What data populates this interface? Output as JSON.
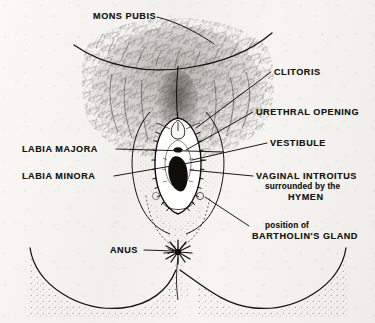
{
  "figure": {
    "media": "pen-and-ink stipple drawing on paper",
    "ink_color": "#16150f",
    "paper_color": "#f4f3f0"
  },
  "labels": {
    "mons_pubis": "MONS PUBIS",
    "clitoris": "CLITORIS",
    "urethral_opening": "URETHRAL OPENING",
    "vestibule": "VESTIBULE",
    "labia_majora": "LABIA MAJORA",
    "labia_minora": "LABIA MINORA",
    "vaginal_introitus": "VAGINAL INTROITUS",
    "vaginal_introitus_line2": "surrounded by the",
    "vaginal_introitus_line3": "HYMEN",
    "bartholin_line1": "position of",
    "bartholin_line2": "BARTHOLIN'S GLAND",
    "anus": "ANUS"
  },
  "callouts": [
    {
      "name": "mons-pubis",
      "text": "MONS PUBIS",
      "side": "top-left",
      "x": 93,
      "y": 12
    },
    {
      "name": "clitoris",
      "text": "CLITORIS",
      "side": "right",
      "x": 274,
      "y": 68
    },
    {
      "name": "urethral-opening",
      "text": "URETHRAL OPENING",
      "side": "right",
      "x": 256,
      "y": 108
    },
    {
      "name": "vestibule",
      "text": "VESTIBULE",
      "side": "right",
      "x": 270,
      "y": 139
    },
    {
      "name": "labia-majora",
      "text": "LABIA MAJORA",
      "side": "left",
      "x": 22,
      "y": 145
    },
    {
      "name": "labia-minora",
      "text": "LABIA MINORA",
      "side": "left",
      "x": 22,
      "y": 172
    },
    {
      "name": "vaginal-introitus",
      "text": "VAGINAL INTROITUS",
      "side": "right",
      "x": 256,
      "y": 172
    },
    {
      "name": "bartholins-gland",
      "text": "BARTHOLIN'S GLAND",
      "side": "right",
      "x": 252,
      "y": 222
    },
    {
      "name": "anus",
      "text": "ANUS",
      "side": "bottom-left",
      "x": 110,
      "y": 246
    }
  ]
}
